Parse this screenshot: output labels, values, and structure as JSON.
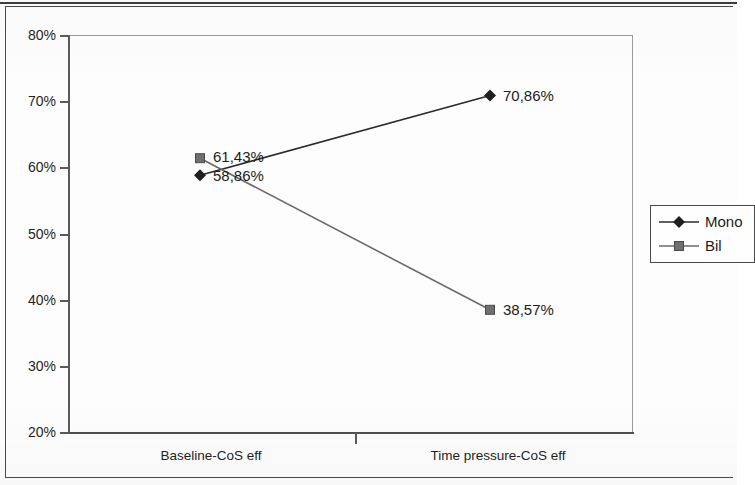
{
  "chart_data": {
    "type": "line",
    "title": "",
    "xlabel": "",
    "ylabel": "",
    "categories": [
      "Baseline-CoS eff",
      "Time pressure-CoS eff"
    ],
    "ylim": [
      20,
      80
    ],
    "ytick_labels": [
      "80%",
      "70%",
      "60%",
      "50%",
      "40%",
      "30%",
      "20%"
    ],
    "ytick_values": [
      80,
      70,
      60,
      50,
      40,
      30,
      20
    ],
    "grid": false,
    "legend_position": "right",
    "series": [
      {
        "name": "Mono",
        "marker": "diamond",
        "color": "#2b2b2b",
        "values": [
          58.86,
          70.86
        ],
        "data_labels": [
          "58,86%",
          "70,86%"
        ]
      },
      {
        "name": "Bil",
        "marker": "square",
        "color": "#5e5e5e",
        "values": [
          61.43,
          38.57
        ],
        "data_labels": [
          "61,43%",
          "38,57%"
        ]
      }
    ]
  },
  "axes": {
    "y": {
      "ticks": [
        {
          "label": "80%",
          "value": 80
        },
        {
          "label": "70%",
          "value": 70
        },
        {
          "label": "60%",
          "value": 60
        },
        {
          "label": "50%",
          "value": 50
        },
        {
          "label": "40%",
          "value": 40
        },
        {
          "label": "30%",
          "value": 30
        },
        {
          "label": "20%",
          "value": 20
        }
      ]
    },
    "x": {
      "categories": [
        {
          "label": "Baseline-CoS eff"
        },
        {
          "label": "Time pressure-CoS eff"
        }
      ]
    }
  },
  "legend": {
    "entries": [
      {
        "label": "Mono",
        "marker": "diamond"
      },
      {
        "label": "Bil",
        "marker": "square"
      }
    ]
  },
  "point_labels": {
    "mono_baseline": "58,86%",
    "mono_timepressure": "70,86%",
    "bil_baseline": "61,43%",
    "bil_timepressure": "38,57%"
  },
  "colors": {
    "mono_line": "#2b2b2b",
    "bil_line": "#6a6a6a",
    "axis": "#5a5a5a",
    "plot_border": "#9a9a9a",
    "text": "#1c1c1c"
  }
}
